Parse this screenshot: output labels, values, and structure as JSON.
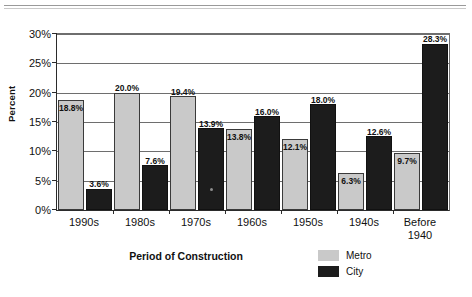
{
  "chart_data": {
    "type": "bar",
    "title": "",
    "xlabel": "Period of Construction",
    "ylabel": "Percent",
    "ylim": [
      0,
      30
    ],
    "ytick_labels": [
      "0%",
      "5%",
      "10%",
      "15%",
      "20%",
      "25%",
      "30%"
    ],
    "ytick_values": [
      0,
      5,
      10,
      15,
      20,
      25,
      30
    ],
    "grid": "horizontal",
    "legend_position": "bottom-right",
    "categories": [
      "1990s",
      "1980s",
      "1970s",
      "1960s",
      "1950s",
      "1940s",
      "Before 1940"
    ],
    "series": [
      {
        "name": "Metro",
        "color": "#c9c9c9",
        "values": [
          18.8,
          20.0,
          19.4,
          13.8,
          12.1,
          6.3,
          9.7
        ],
        "data_labels": [
          "18.8%",
          "20.0%",
          "19.4%",
          "13.8%",
          "12.1%",
          "6.3%",
          "9.7%"
        ]
      },
      {
        "name": "City",
        "color": "#1c1c1c",
        "values": [
          3.6,
          7.6,
          13.9,
          16.0,
          18.0,
          12.6,
          28.3
        ],
        "data_labels": [
          "3.6%",
          "7.6%",
          "13.9%",
          "16.0%",
          "18.0%",
          "12.6%",
          "28.3%"
        ]
      }
    ]
  },
  "axis": {
    "y_title": "Percent",
    "x_title": "Period of Construction",
    "y_ticks": [
      {
        "label": "30%",
        "value": 30
      },
      {
        "label": "25%",
        "value": 25
      },
      {
        "label": "20%",
        "value": 20
      },
      {
        "label": "15%",
        "value": 15
      },
      {
        "label": "10%",
        "value": 10
      },
      {
        "label": "5%",
        "value": 5
      },
      {
        "label": "0%",
        "value": 0
      }
    ],
    "x_ticks": [
      {
        "line1": "1990s",
        "line2": ""
      },
      {
        "line1": "1980s",
        "line2": ""
      },
      {
        "line1": "1970s",
        "line2": ""
      },
      {
        "line1": "1960s",
        "line2": ""
      },
      {
        "line1": "1950s",
        "line2": ""
      },
      {
        "line1": "1940s",
        "line2": ""
      },
      {
        "line1": "Before",
        "line2": "1940"
      }
    ]
  },
  "legend": {
    "items": [
      {
        "label": "Metro",
        "color": "#c9c9c9"
      },
      {
        "label": "City",
        "color": "#1c1c1c"
      }
    ]
  }
}
